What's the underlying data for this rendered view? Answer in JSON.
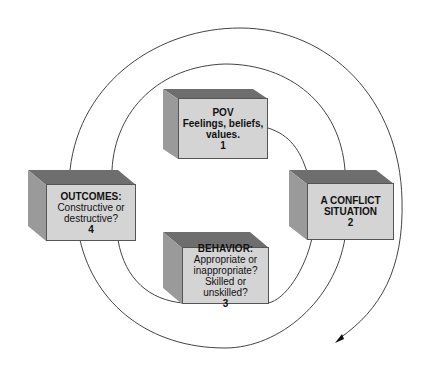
{
  "diagram": {
    "type": "spiral-cycle",
    "colors": {
      "front_face": "#d4d4d4",
      "top_face": "#6e6e6e",
      "side_face": "#9a9a9a",
      "line": "#444444"
    },
    "boxes": [
      {
        "id": "pov",
        "title": "POV",
        "lines": [
          "Feelings, beliefs,",
          "values."
        ],
        "number": "1",
        "title_bold": true,
        "lines_bold": true
      },
      {
        "id": "conflict",
        "title": "A CONFLICT",
        "lines": [
          "SITUATION"
        ],
        "number": "2",
        "title_bold": true,
        "lines_bold": true
      },
      {
        "id": "behavior",
        "title": "BEHAVIOR:",
        "lines": [
          "Appropriate or",
          "inappropriate?",
          "Skilled or unskilled?"
        ],
        "number": "3",
        "title_bold": true,
        "lines_bold": false
      },
      {
        "id": "outcomes",
        "title": "OUTCOMES:",
        "lines": [
          "Constructive or",
          "destructive?"
        ],
        "number": "4",
        "title_bold": true,
        "lines_bold": false
      }
    ],
    "arrow": {
      "direction": "down-left",
      "position": "bottom-right"
    }
  }
}
